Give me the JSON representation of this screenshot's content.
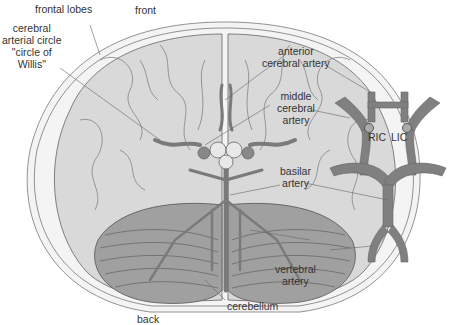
{
  "diagram": {
    "colors": {
      "background": "#ffffff",
      "brain_fill": "#d9d9d9",
      "cerebellum_fill": "#9a9a9a",
      "artery_fill": "#7f7f7f",
      "outline": "#555555",
      "label_text": "#333333",
      "leader_line": "#666666"
    },
    "orientation": {
      "front": "front",
      "back": "back"
    },
    "labels": {
      "frontal_lobes": "frontal lobes",
      "circle_willis_1": "cerebral",
      "circle_willis_2": "arterial circle",
      "circle_willis_3": "\"circle of",
      "circle_willis_4": "Willis\"",
      "anterior_1": "anterior",
      "anterior_2": "cerebral artery",
      "middle_1": "middle",
      "middle_2": "cerebral",
      "middle_3": "artery",
      "basilar_1": "basilar",
      "basilar_2": "artery",
      "vertebral_1": "vertebral",
      "vertebral_2": "artery",
      "cerebellum": "cerebellum"
    },
    "schematic": {
      "ric": "RIC",
      "lic": "LIC"
    }
  }
}
